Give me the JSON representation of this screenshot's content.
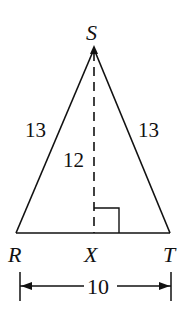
{
  "figure": {
    "type": "isosceles triangle with altitude",
    "vertices": {
      "S": {
        "label": "S",
        "x": 94,
        "y": 49
      },
      "R": {
        "label": "R",
        "x": 16,
        "y": 233
      },
      "T": {
        "label": "T",
        "x": 170,
        "y": 233
      },
      "X": {
        "label": "X",
        "x": 94,
        "y": 233
      }
    },
    "side_labels": {
      "SR": "13",
      "ST": "13",
      "SX": "12",
      "RT": "10"
    },
    "right_angle_at": "X",
    "altitude_style": "dashed",
    "stroke_color": "#111111",
    "background": "#ffffff"
  }
}
